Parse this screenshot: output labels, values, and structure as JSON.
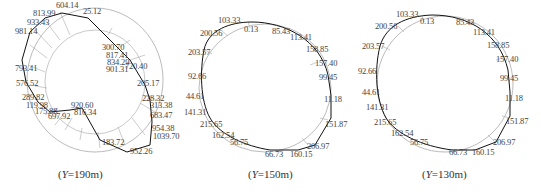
{
  "panels": [
    {
      "caption_prefix": "(",
      "caption_var": "Y",
      "caption_suffix": "=190m)",
      "labels": [
        {
          "t": "604.14",
          "x": 56,
          "y": 1
        },
        {
          "t": "813.99",
          "x": 33,
          "y": 9
        },
        {
          "t": "25.12",
          "x": 83,
          "y": 7
        },
        {
          "t": "933.43",
          "x": 27,
          "y": 18
        },
        {
          "t": "981.14",
          "x": 15,
          "y": 27
        },
        {
          "t": "300.70",
          "x": 102,
          "y": 43
        },
        {
          "t": "817.41",
          "x": 106,
          "y": 51
        },
        {
          "t": "834.29",
          "x": 107,
          "y": 58
        },
        {
          "t": "901.31",
          "x": 106,
          "y": 65
        },
        {
          "t": "720.40",
          "x": 125,
          "y": 62
        },
        {
          "t": "793.41",
          "x": 15,
          "y": 64
        },
        {
          "t": "205.17",
          "x": 137,
          "y": 79
        },
        {
          "t": "576.52",
          "x": 16,
          "y": 79
        },
        {
          "t": "228.32",
          "x": 142,
          "y": 94
        },
        {
          "t": "289.82",
          "x": 22,
          "y": 93
        },
        {
          "t": "920.60",
          "x": 71,
          "y": 101
        },
        {
          "t": "119.98",
          "x": 26,
          "y": 101
        },
        {
          "t": "313.38",
          "x": 150,
          "y": 101
        },
        {
          "t": "175.88",
          "x": 35,
          "y": 107
        },
        {
          "t": "697.92",
          "x": 48,
          "y": 112
        },
        {
          "t": "816.34",
          "x": 74,
          "y": 108
        },
        {
          "t": "683.47",
          "x": 150,
          "y": 111
        },
        {
          "t": "954.38",
          "x": 152,
          "y": 124
        },
        {
          "t": "1039.70",
          "x": 153,
          "y": 132
        },
        {
          "t": "183.72",
          "x": 102,
          "y": 138
        },
        {
          "t": "952.26",
          "x": 130,
          "y": 147
        }
      ]
    },
    {
      "caption_prefix": "(",
      "caption_var": "Y",
      "caption_suffix": "=150m)",
      "labels": [
        {
          "t": "103.33",
          "x": 28,
          "y": 16
        },
        {
          "t": "0.13",
          "x": 54,
          "y": 25
        },
        {
          "t": "200.56",
          "x": 10,
          "y": 29
        },
        {
          "t": "85.43",
          "x": 82,
          "y": 27
        },
        {
          "t": "113.41",
          "x": 100,
          "y": 33
        },
        {
          "t": "203.57",
          "x": -2,
          "y": 48
        },
        {
          "t": "158.85",
          "x": 116,
          "y": 45
        },
        {
          "t": "157.40",
          "x": 125,
          "y": 59
        },
        {
          "t": "92.66",
          "x": -2,
          "y": 72
        },
        {
          "t": "99.45",
          "x": 129,
          "y": 73
        },
        {
          "t": "44.61",
          "x": -4,
          "y": 92
        },
        {
          "t": "11.18",
          "x": 134,
          "y": 95
        },
        {
          "t": "141.31",
          "x": -6,
          "y": 108
        },
        {
          "t": "215.65",
          "x": 10,
          "y": 120
        },
        {
          "t": "151.87",
          "x": 135,
          "y": 120
        },
        {
          "t": "162.54",
          "x": 22,
          "y": 131
        },
        {
          "t": "56.75",
          "x": 40,
          "y": 138
        },
        {
          "t": "206.97",
          "x": 117,
          "y": 142
        },
        {
          "t": "66.73",
          "x": 75,
          "y": 150
        },
        {
          "t": "160.15",
          "x": 100,
          "y": 150
        }
      ]
    },
    {
      "caption_prefix": "(",
      "caption_var": "Y",
      "caption_suffix": "=130m)",
      "labels": [
        {
          "t": "103.33",
          "x": 36,
          "y": 10
        },
        {
          "t": "0.13",
          "x": 60,
          "y": 17
        },
        {
          "t": "200.56",
          "x": 15,
          "y": 22
        },
        {
          "t": "85.43",
          "x": 96,
          "y": 18
        },
        {
          "t": "113.41",
          "x": 113,
          "y": 28
        },
        {
          "t": "203.57",
          "x": 2,
          "y": 42
        },
        {
          "t": "158.85",
          "x": 127,
          "y": 41
        },
        {
          "t": "157.40",
          "x": 136,
          "y": 55
        },
        {
          "t": "92.66",
          "x": -2,
          "y": 67
        },
        {
          "t": "99.45",
          "x": 140,
          "y": 74
        },
        {
          "t": "44.61",
          "x": 2,
          "y": 88
        },
        {
          "t": "11.18",
          "x": 145,
          "y": 94
        },
        {
          "t": "141.31",
          "x": 6,
          "y": 103
        },
        {
          "t": "215.65",
          "x": 14,
          "y": 118
        },
        {
          "t": "151.87",
          "x": 146,
          "y": 117
        },
        {
          "t": "162.54",
          "x": 31,
          "y": 129
        },
        {
          "t": "56.75",
          "x": 50,
          "y": 138
        },
        {
          "t": "206.97",
          "x": 133,
          "y": 138
        },
        {
          "t": "66.73",
          "x": 89,
          "y": 148
        },
        {
          "t": "160.15",
          "x": 112,
          "y": 148
        }
      ]
    }
  ]
}
